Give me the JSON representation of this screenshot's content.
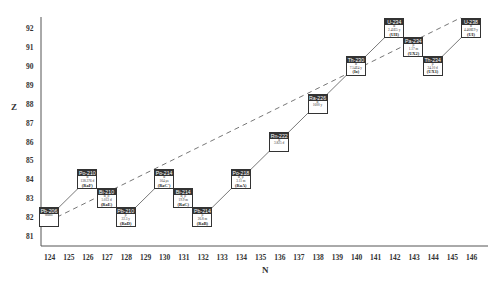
{
  "chart_data": {
    "type": "scatter",
    "title": "",
    "xlabel": "N",
    "ylabel": "Z",
    "x_ticks": [
      124,
      125,
      126,
      127,
      128,
      129,
      130,
      131,
      132,
      133,
      134,
      135,
      136,
      137,
      138,
      139,
      140,
      141,
      142,
      143,
      144,
      145,
      146
    ],
    "y_ticks": [
      81,
      82,
      83,
      84,
      85,
      86,
      87,
      88,
      89,
      90,
      91,
      92
    ],
    "xlim": [
      124,
      146
    ],
    "ylim": [
      81,
      92
    ],
    "grid": false,
    "nuclides": [
      {
        "name": "U-238",
        "N": 146,
        "Z": 92,
        "decay": "α",
        "half_life": "4.468E9 y",
        "alias": "(UI)"
      },
      {
        "name": "Th-234",
        "N": 144,
        "Z": 90,
        "decay": "β",
        "half_life": "24.10 d",
        "alias": "(UX1)"
      },
      {
        "name": "Pa-234",
        "N": 143,
        "Z": 91,
        "decay": "β",
        "half_life": "1.17 m",
        "alias": "(UX2)"
      },
      {
        "name": "U-234",
        "N": 142,
        "Z": 92,
        "decay": "α",
        "half_life": "2.45E5 y",
        "alias": "(UII)"
      },
      {
        "name": "Th-230",
        "N": 140,
        "Z": 90,
        "decay": "α",
        "half_life": "7.54E4 y",
        "alias": "(Io)"
      },
      {
        "name": "Ra-226",
        "N": 138,
        "Z": 88,
        "decay": "α",
        "half_life": "1600 y",
        "alias": ""
      },
      {
        "name": "Rn-222",
        "N": 136,
        "Z": 86,
        "decay": "α",
        "half_life": "3.825 d",
        "alias": ""
      },
      {
        "name": "Po-218",
        "N": 134,
        "Z": 84,
        "decay": "α, β",
        "half_life": "3.11 m",
        "alias": "(RaA)"
      },
      {
        "name": "Pb-214",
        "N": 132,
        "Z": 82,
        "decay": "β",
        "half_life": "26.8 m",
        "alias": "(RaB)"
      },
      {
        "name": "Bi-214",
        "N": 131,
        "Z": 83,
        "decay": "α, β",
        "half_life": "19.9 m",
        "alias": "(RaC)"
      },
      {
        "name": "Po-214",
        "N": 130,
        "Z": 84,
        "decay": "α",
        "half_life": "164 μs",
        "alias": "(RaC′)"
      },
      {
        "name": "Pb-210",
        "N": 128,
        "Z": 82,
        "decay": "β",
        "half_life": "22.3 y",
        "alias": "(RaD)"
      },
      {
        "name": "Bi-210",
        "N": 127,
        "Z": 83,
        "decay": "α, β",
        "half_life": "5.013 d",
        "alias": "(RaE)"
      },
      {
        "name": "Po-210",
        "N": 126,
        "Z": 84,
        "decay": "α",
        "half_life": "138.376 d",
        "alias": "(RaF)"
      },
      {
        "name": "Pb-206",
        "N": 124,
        "Z": 82,
        "decay": "",
        "half_life": "stable",
        "alias": ""
      }
    ],
    "decay_chain": [
      "U-238",
      "Th-234",
      "Pa-234",
      "U-234",
      "Th-230",
      "Ra-226",
      "Rn-222",
      "Po-218",
      "Pb-214",
      "Bi-214",
      "Po-214",
      "Pb-210",
      "Bi-210",
      "Po-210",
      "Pb-206"
    ],
    "dashed_line": {
      "from": [
        124,
        82
      ],
      "to": [
        146,
        92.5
      ]
    }
  },
  "axes": {
    "x_title": "N",
    "y_title": "Z"
  },
  "colors": {
    "line": "#555555",
    "box_border": "#333333",
    "background": "#ffffff"
  }
}
